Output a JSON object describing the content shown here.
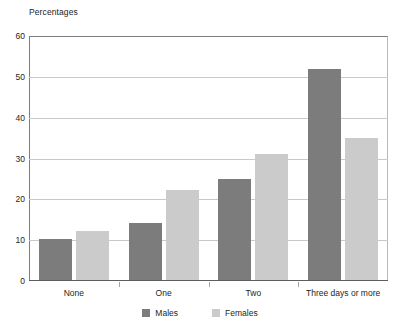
{
  "chart_data": {
    "type": "bar",
    "title": "",
    "ylabel": "Percentages",
    "xlabel": "",
    "ylim": [
      0,
      60
    ],
    "yticks": [
      0,
      10,
      20,
      30,
      40,
      50,
      60
    ],
    "grid": true,
    "legend_position": "bottom-center",
    "categories": [
      "None",
      "One",
      "Two",
      "Three days or more"
    ],
    "series": [
      {
        "name": "Males",
        "color": "#7c7c7c",
        "values": [
          10.3,
          14.3,
          25.0,
          52.0
        ]
      },
      {
        "name": "Females",
        "color": "#cbcbcb",
        "values": [
          12.3,
          22.2,
          31.0,
          35.0
        ]
      }
    ]
  },
  "legend": {
    "items": [
      {
        "label": "Males"
      },
      {
        "label": "Females"
      }
    ]
  }
}
